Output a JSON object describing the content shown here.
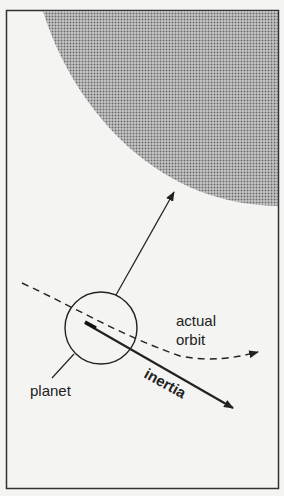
{
  "diagram": {
    "labels": {
      "actual_orbit_line1": "actual",
      "actual_orbit_line2": "orbit",
      "planet": "planet",
      "inertia": "inertia"
    },
    "colors": {
      "frame": "#333333",
      "sun_fill": "#9a9a9a",
      "background": "#f4f4f2",
      "stroke": "#222222"
    }
  }
}
